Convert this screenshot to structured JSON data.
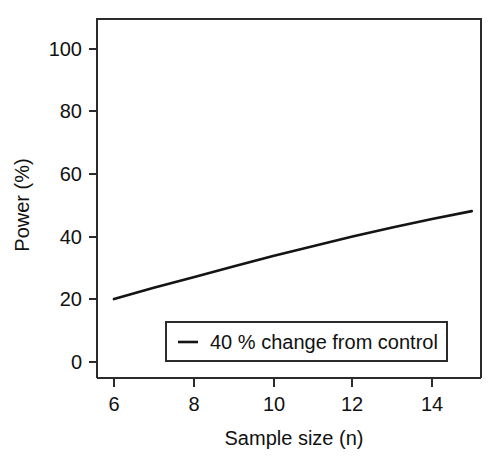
{
  "chart_data": {
    "type": "line",
    "title": "",
    "xlabel": "Sample size (n)",
    "ylabel": "Power (%)",
    "xlim": [
      5.4,
      15.6
    ],
    "ylim": [
      -3,
      110
    ],
    "xticks": [
      6,
      8,
      10,
      12,
      14
    ],
    "xticklabels": [
      "6",
      "8",
      "10",
      "12",
      "14"
    ],
    "yticks": [
      0,
      20,
      40,
      60,
      80,
      100
    ],
    "yticklabels": [
      "0",
      "20",
      "40",
      "60",
      "80",
      "100"
    ],
    "grid": false,
    "legend_position": "bottom-right-inside",
    "series": [
      {
        "name": "40 % change from control",
        "color": "#141414",
        "x": [
          6,
          7,
          8,
          9,
          10,
          11,
          12,
          13,
          14,
          15
        ],
        "values": [
          20.1,
          23.7,
          27.1,
          30.5,
          33.9,
          37.0,
          40.1,
          43.0,
          45.7,
          48.2
        ]
      }
    ],
    "legend": [
      {
        "label": "40 % change from control",
        "marker": "line",
        "color": "#141414"
      }
    ]
  },
  "axes": {
    "x_axis_label": "Sample size (n)",
    "y_axis_label": "Power (%)"
  },
  "ticks": {
    "x": [
      "6",
      "8",
      "10",
      "12",
      "14"
    ],
    "y": [
      "0",
      "20",
      "40",
      "60",
      "80",
      "100"
    ]
  },
  "legend": {
    "entry_label": "40 % change from control"
  },
  "colors": {
    "line": "#141414",
    "axis": "#2b2b2b",
    "text": "#111111",
    "background": "#ffffff"
  }
}
